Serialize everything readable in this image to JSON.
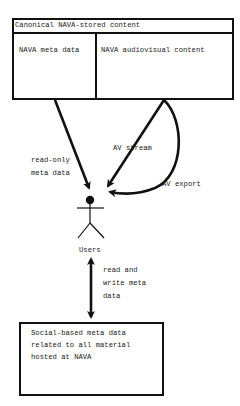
{
  "diagram": {
    "container": {
      "title": "Canonical NAVA-stored content",
      "left_cell": "NAVA meta data",
      "right_cell": "NAVA audiovisual content"
    },
    "actor": {
      "label": "Users"
    },
    "edges": [
      {
        "from": "NAVA meta data",
        "to": "Users",
        "label_lines": [
          "read-only",
          "meta data"
        ],
        "style": "straight",
        "direction": "one-way"
      },
      {
        "from": "NAVA audiovisual content",
        "to": "Users",
        "label": "AV stream",
        "style": "straight",
        "direction": "one-way"
      },
      {
        "from": "NAVA audiovisual content",
        "to": "Users",
        "label": "AV export",
        "style": "curved",
        "direction": "one-way"
      },
      {
        "from": "Users",
        "to": "Social-based meta data",
        "label_lines": [
          "read and",
          "write meta",
          "data"
        ],
        "style": "straight",
        "direction": "two-way"
      }
    ],
    "bottom_box": {
      "lines": [
        "Social-based meta data",
        "related to all material",
        "hosted at NAVA"
      ]
    }
  }
}
